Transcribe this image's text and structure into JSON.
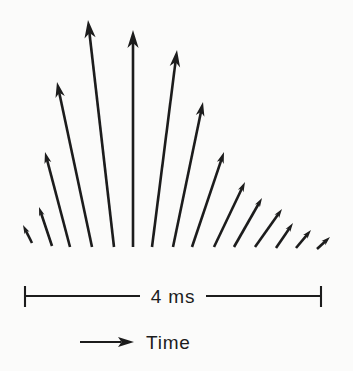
{
  "colors": {
    "ink": "#1c1c1c",
    "background": "#fbfbfa"
  },
  "scale_bar": {
    "label": "4 ms"
  },
  "time_legend": {
    "label": "Time"
  },
  "chart_data": {
    "type": "vector-fan",
    "baseline_y": 247,
    "vectors": [
      {
        "x1": 32,
        "y1": 243,
        "x2": 23,
        "y2": 225
      },
      {
        "x1": 52,
        "y1": 246,
        "x2": 39,
        "y2": 207
      },
      {
        "x1": 70,
        "y1": 247,
        "x2": 45,
        "y2": 152
      },
      {
        "x1": 92,
        "y1": 247,
        "x2": 57,
        "y2": 82
      },
      {
        "x1": 114,
        "y1": 247,
        "x2": 88,
        "y2": 20
      },
      {
        "x1": 133,
        "y1": 247,
        "x2": 133,
        "y2": 30
      },
      {
        "x1": 152,
        "y1": 247,
        "x2": 177,
        "y2": 50
      },
      {
        "x1": 173,
        "y1": 247,
        "x2": 203,
        "y2": 102
      },
      {
        "x1": 192,
        "y1": 247,
        "x2": 224,
        "y2": 152
      },
      {
        "x1": 214,
        "y1": 247,
        "x2": 245,
        "y2": 182
      },
      {
        "x1": 234,
        "y1": 247,
        "x2": 262,
        "y2": 198
      },
      {
        "x1": 255,
        "y1": 247,
        "x2": 282,
        "y2": 209
      },
      {
        "x1": 276,
        "y1": 248,
        "x2": 293,
        "y2": 223
      },
      {
        "x1": 296,
        "y1": 248,
        "x2": 311,
        "y2": 230
      },
      {
        "x1": 317,
        "y1": 249,
        "x2": 330,
        "y2": 237
      }
    ]
  }
}
